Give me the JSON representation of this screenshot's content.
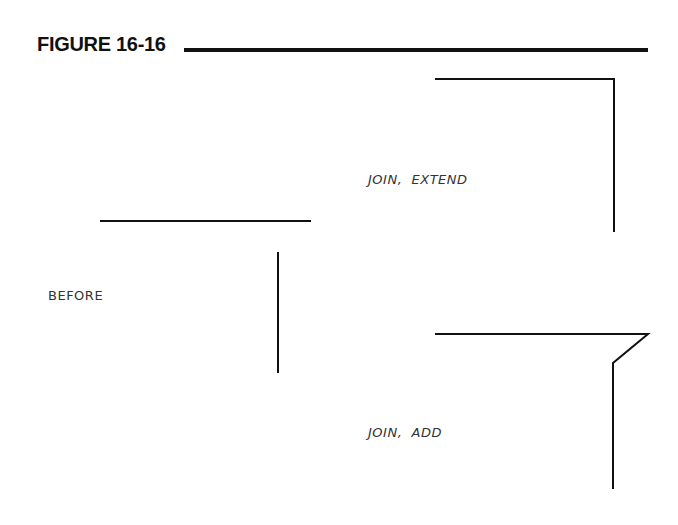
{
  "figure": {
    "title": "FIGURE 16-16"
  },
  "labels": {
    "before": "BEFORE",
    "join_extend": "JOIN,  EXTEND",
    "join_add": "JOIN,  ADD"
  },
  "colors": {
    "line": "#111111",
    "text": "#333333",
    "background": "#ffffff"
  }
}
